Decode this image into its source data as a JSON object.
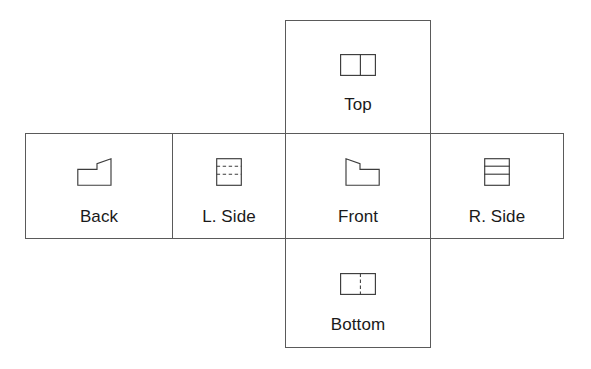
{
  "sheet": {
    "title": "Orthographic projection views of a stepped block",
    "background_color": "#ffffff",
    "cell_border_color": "#5a5a5a",
    "line_color": "#3c3c3c",
    "label_color": "#1a1a1a",
    "layout": "cross",
    "view_count": 6
  },
  "views": {
    "top": {
      "label": "Top",
      "figure_name": "rectangle-with-solid-vertical-divider",
      "line_style": "solid",
      "description": "Rectangle divided by a solid vertical line right of center"
    },
    "back": {
      "label": "Back",
      "figure_name": "stepped-profile-rising-right",
      "line_style": "solid",
      "description": "Stepped L-profile, low at left rising through a diagonal to a taller step at right"
    },
    "left_side": {
      "label": "L. Side",
      "figure_name": "square-with-two-dashed-horizontal-lines",
      "line_style": "dashed",
      "description": "Square containing two dashed horizontal hidden edges in the upper portion"
    },
    "front": {
      "label": "Front",
      "figure_name": "stepped-profile-descending-right",
      "line_style": "solid",
      "description": "Stepped L-profile, tall at left stepping down through a diagonal to a lower step at right"
    },
    "right_side": {
      "label": "R. Side",
      "figure_name": "square-with-two-solid-horizontal-lines",
      "line_style": "solid",
      "description": "Square containing two solid horizontal visible edges in the upper portion"
    },
    "bottom": {
      "label": "Bottom",
      "figure_name": "rectangle-with-dashed-vertical-divider",
      "line_style": "dashed",
      "description": "Rectangle divided by a dashed vertical hidden edge right of center"
    }
  }
}
